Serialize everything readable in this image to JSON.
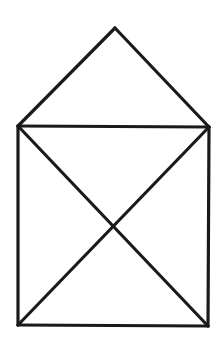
{
  "figure": {
    "background_color": "#ffffff",
    "stroke_color": "#1a1a1a",
    "stroke_width": 3.2,
    "vertices": {
      "apex": [
        115,
        28
      ],
      "top_left": [
        18,
        126
      ],
      "top_right": [
        209,
        127
      ],
      "bottom_left": [
        18,
        325
      ],
      "bottom_right": [
        208,
        326
      ]
    },
    "edges": [
      {
        "name": "roof-left-edge",
        "from": "top_left",
        "to": "apex"
      },
      {
        "name": "roof-right-edge",
        "from": "apex",
        "to": "top_right"
      },
      {
        "name": "top-edge",
        "from": "top_left",
        "to": "top_right"
      },
      {
        "name": "left-wall-edge",
        "from": "top_left",
        "to": "bottom_left"
      },
      {
        "name": "right-wall-edge",
        "from": "top_right",
        "to": "bottom_right"
      },
      {
        "name": "bottom-edge",
        "from": "bottom_left",
        "to": "bottom_right"
      },
      {
        "name": "diagonal-tl-br-edge",
        "from": "top_left",
        "to": "bottom_right"
      },
      {
        "name": "diagonal-tr-bl-edge",
        "from": "top_right",
        "to": "bottom_left"
      }
    ]
  }
}
